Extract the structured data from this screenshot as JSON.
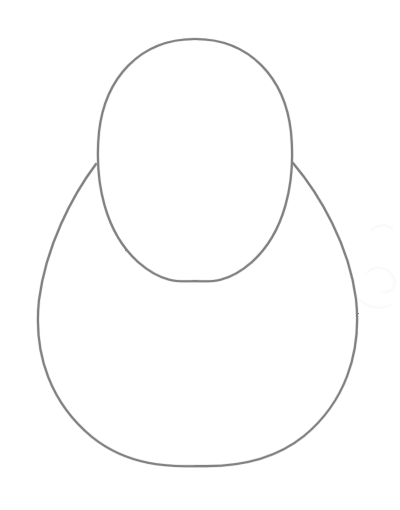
{
  "image": {
    "kind": "pencil-sketch",
    "title": "Pencil construction sketch: head oval over body circle",
    "description": "A hand-drawn graphite line drawing on white paper showing two overlapping construction shapes used as the base of a figure drawing: a tall egg-shaped oval on top and a larger circle beneath it.",
    "width": 400,
    "height": 510,
    "background_color": "#ffffff",
    "caption": "Two overlapping pencil construction shapes"
  },
  "style": {
    "stroke_color": "#7b7b7b",
    "stroke_color_dark": "#5f5f5f",
    "stroke_color_light": "#9a9a9a",
    "stroke_width": 2.1,
    "stroke_width_inner": 1.1,
    "paper_color": "#ffffff",
    "artifact_color": "#f4f5f6"
  },
  "shapes": [
    {
      "name": "head-oval",
      "label": "Head oval",
      "type": "ellipse",
      "cx": 195,
      "cy": 160,
      "rx": 98,
      "ry": 121,
      "top_y": 39,
      "bottom_y": 281,
      "left_x": 97,
      "right_x": 293,
      "path": "M 195 39 C 250 39 285 78 291 132 C 296 184 284 233 252 262 C 228 283 211 282 195 281 C 179 282 162 283 138 262 C 106 233 94 184 99 132 C 105 78 140 39 195 39 Z"
    },
    {
      "name": "body-circle",
      "label": "Body circle",
      "type": "circle",
      "cx": 197,
      "cy": 315,
      "rx": 159,
      "ry": 152,
      "top_y": 163,
      "bottom_y": 466,
      "left_x": 38,
      "right_x": 357,
      "path": "M 96 164 C 72 196 46 246 39 300 C 33 356 52 404 92 437 C 128 466 170 467 197 466 C 224 467 268 465 304 436 C 344 403 362 354 356 299 C 349 245 320 195 293 163"
    }
  ],
  "artifacts": [
    {
      "name": "scan-smudge-upper-right",
      "path": "M 372 230 C 378 224 386 224 392 229",
      "opacity": 0.55
    },
    {
      "name": "scan-smudge-mid-right",
      "path": "M 366 274 C 374 264 388 266 394 278 C 397 286 390 294 382 292",
      "opacity": 0.5
    },
    {
      "name": "scan-smudge-lower-right",
      "path": "M 360 300 C 368 308 382 310 392 304",
      "opacity": 0.45
    }
  ]
}
